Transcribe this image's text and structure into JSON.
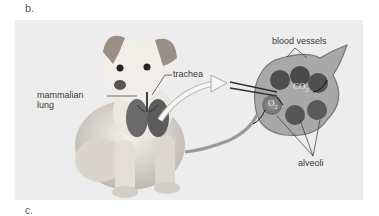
{
  "panels": {
    "current_label": "b.",
    "next_label": "c."
  },
  "figure": {
    "labels": {
      "trachea": "trachea",
      "mammalian_lung_line1": "mammalian",
      "mammalian_lung_line2": "lung",
      "blood_vessels": "blood vessels",
      "co2": "CO",
      "co2_sub": "2",
      "o2": "O",
      "o2_sub": "2",
      "alveoli": "alveoli"
    },
    "colors": {
      "panel_bg": "#ededed",
      "text": "#3a3a3a",
      "dog_body": "#e6e2dc",
      "alveoli_dark": "#555555",
      "vessel": "#8a8a8a"
    }
  }
}
